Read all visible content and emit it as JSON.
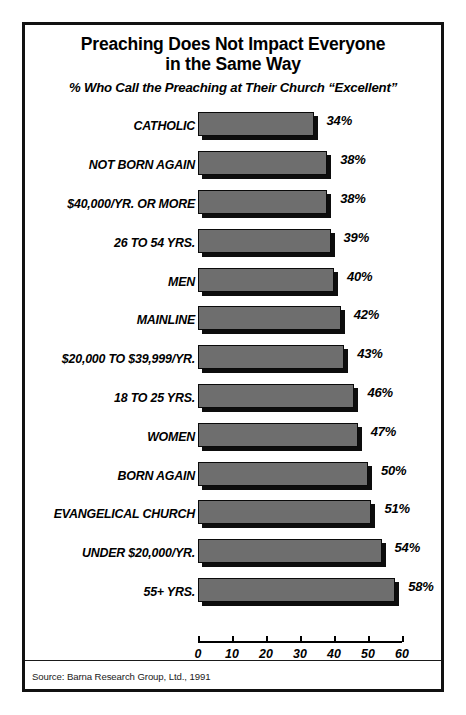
{
  "chart_data": {
    "type": "bar",
    "orientation": "horizontal",
    "title": "Preaching Does Not Impact Everyone in the Same Way",
    "title_lines": [
      "Preaching Does Not Impact Everyone",
      "in the Same Way"
    ],
    "subtitle": "% Who Call the Preaching at Their Church “Excellent”",
    "xlabel": "",
    "ylabel": "",
    "xlim": [
      0,
      60
    ],
    "xticks": [
      0,
      10,
      20,
      30,
      40,
      50,
      60
    ],
    "xtick_labels": [
      "0",
      "10",
      "20",
      "30",
      "40",
      "50",
      "60"
    ],
    "grid": false,
    "legend": "none",
    "categories": [
      "CATHOLIC",
      "NOT BORN AGAIN",
      "$40,000/YR. OR MORE",
      "26 TO 54 YRS.",
      "MEN",
      "MAINLINE",
      "$20,000 TO $39,999/YR.",
      "18 TO 25 YRS.",
      "WOMEN",
      "BORN AGAIN",
      "EVANGELICAL CHURCH",
      "UNDER $20,000/YR.",
      "55+ YRS."
    ],
    "values": [
      34,
      38,
      38,
      39,
      40,
      42,
      43,
      46,
      47,
      50,
      51,
      54,
      58
    ],
    "value_labels": [
      "34%",
      "38%",
      "38%",
      "39%",
      "40%",
      "42%",
      "43%",
      "46%",
      "47%",
      "50%",
      "51%",
      "54%",
      "58%"
    ],
    "bar_color": "#6e6e6e",
    "bar_edge_color": "#0a0a0a",
    "shadow_color": "#0d0d0d"
  },
  "source": "Source: Barna Research Group, Ltd., 1991",
  "colors": {
    "frame": "#111111",
    "background": "#ffffff",
    "text": "#000000"
  }
}
